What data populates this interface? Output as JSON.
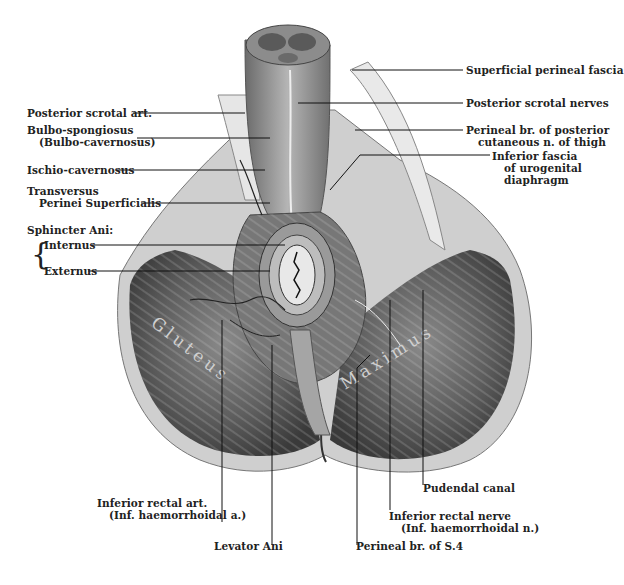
{
  "figure": {
    "muscle_text_left": "Gluteus",
    "muscle_text_right": "Maximus"
  },
  "labels_left": [
    {
      "id": "posterior-scrotal-art",
      "lines": [
        "Posterior scrotal art."
      ]
    },
    {
      "id": "bulbo-spongiosus",
      "lines": [
        "Bulbo-spongiosus",
        "(Bulbo-cavernosus)"
      ]
    },
    {
      "id": "ischio-cavernosus",
      "lines": [
        "Ischio-cavernosus"
      ]
    },
    {
      "id": "transversus-perinei",
      "lines": [
        "Transversus",
        "Perinei Superficialis"
      ]
    },
    {
      "id": "sphincter-ani",
      "lines": [
        "Sphincter Ani:"
      ]
    },
    {
      "id": "internus",
      "lines": [
        "Internus"
      ]
    },
    {
      "id": "externus",
      "lines": [
        "Externus"
      ]
    }
  ],
  "labels_right": [
    {
      "id": "superficial-perineal-fascia",
      "lines": [
        "Superficial perineal fascia"
      ]
    },
    {
      "id": "posterior-scrotal-nerves",
      "lines": [
        "Posterior scrotal nerves"
      ]
    },
    {
      "id": "perineal-br-posterior-cutaneous",
      "lines": [
        "Perineal br. of posterior",
        "cutaneous n. of thigh"
      ]
    },
    {
      "id": "inferior-fascia-urogenital",
      "lines": [
        "Inferior fascia",
        "of urogenital",
        "diaphragm"
      ]
    }
  ],
  "labels_bottom": [
    {
      "id": "inferior-rectal-art",
      "lines": [
        "Inferior rectal art.",
        "(Inf. haemorrhoidal a.)"
      ]
    },
    {
      "id": "levator-ani",
      "lines": [
        "Levator Ani"
      ]
    },
    {
      "id": "perineal-br-s4",
      "lines": [
        "Perineal br. of S.4"
      ]
    },
    {
      "id": "inferior-rectal-nerve",
      "lines": [
        "Inferior rectal nerve",
        "(Inf. haemorrhoidal n.)"
      ]
    },
    {
      "id": "pudendal-canal",
      "lines": [
        "Pudendal canal"
      ]
    }
  ]
}
